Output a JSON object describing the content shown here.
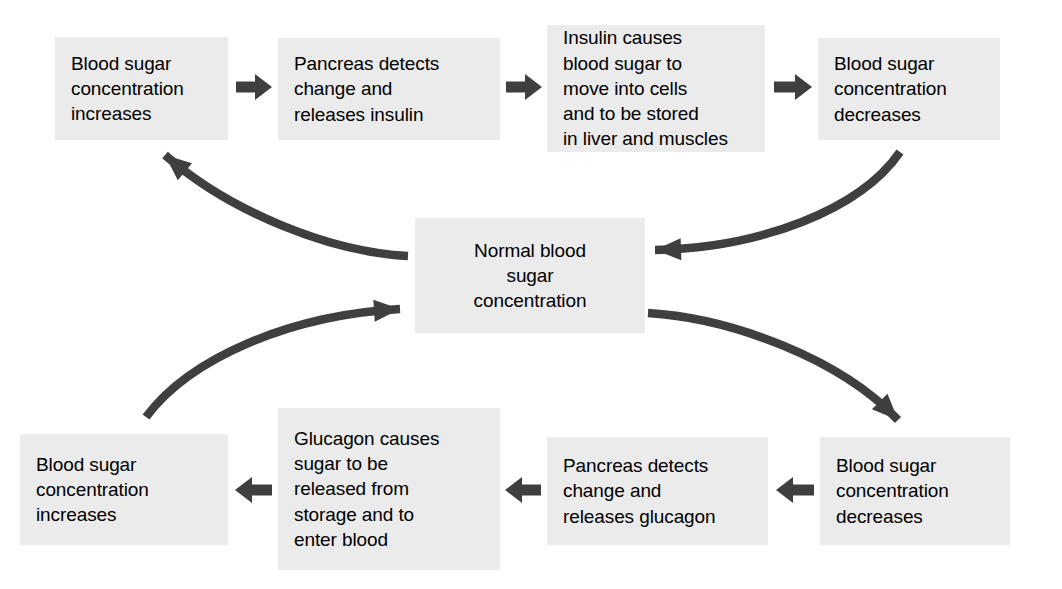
{
  "diagram": {
    "colors": {
      "box_fill": "#ebebeb",
      "text": "#000000",
      "arrow": "#3f3f3f",
      "background": "#ffffff"
    },
    "nodes": [
      {
        "id": "node-top-1",
        "name": "blood-sugar-increases-top",
        "label": "Blood sugar\nconcentration\nincreases",
        "align": "left",
        "x": 55,
        "y": 37,
        "w": 173,
        "h": 103
      },
      {
        "id": "node-top-2",
        "name": "pancreas-releases-insulin",
        "label": "Pancreas detects\nchange and\nreleases insulin",
        "align": "left",
        "x": 278,
        "y": 38,
        "w": 222,
        "h": 102
      },
      {
        "id": "node-top-3",
        "name": "insulin-action",
        "label": "Insulin causes\nblood sugar to\nmove into cells\nand to be stored\nin liver and muscles",
        "align": "left",
        "x": 547,
        "y": 25,
        "w": 218,
        "h": 127
      },
      {
        "id": "node-top-4",
        "name": "blood-sugar-decreases-top",
        "label": "Blood sugar\nconcentration\ndecreases",
        "align": "left",
        "x": 818,
        "y": 38,
        "w": 182,
        "h": 102
      },
      {
        "id": "node-center",
        "name": "normal-blood-sugar-concentration",
        "label": "Normal blood\nsugar\nconcentration",
        "align": "center",
        "x": 415,
        "y": 218,
        "w": 230,
        "h": 115
      },
      {
        "id": "node-bottom-1",
        "name": "blood-sugar-increases-bottom",
        "label": "Blood sugar\nconcentration\nincreases",
        "align": "left",
        "x": 20,
        "y": 434,
        "w": 208,
        "h": 111
      },
      {
        "id": "node-bottom-2",
        "name": "glucagon-action",
        "label": "Glucagon causes\nsugar to be\nreleased from\nstorage and to\nenter blood",
        "align": "left",
        "x": 278,
        "y": 408,
        "w": 222,
        "h": 162
      },
      {
        "id": "node-bottom-3",
        "name": "pancreas-releases-glucagon",
        "label": "Pancreas detects\nchange and\nreleases glucagon",
        "align": "left",
        "x": 547,
        "y": 437,
        "w": 221,
        "h": 108
      },
      {
        "id": "node-bottom-4",
        "name": "blood-sugar-decreases-bottom",
        "label": "Blood sugar\nconcentration\ndecreases",
        "align": "left",
        "x": 820,
        "y": 437,
        "w": 190,
        "h": 108
      }
    ],
    "straight_arrows": [
      {
        "name": "arrow-top-1-to-2",
        "direction": "right",
        "x1": 236,
        "y1": 87,
        "x2": 272,
        "y2": 87
      },
      {
        "name": "arrow-top-2-to-3",
        "direction": "right",
        "x1": 506,
        "y1": 87,
        "x2": 542,
        "y2": 87
      },
      {
        "name": "arrow-top-3-to-4",
        "direction": "right",
        "x1": 774,
        "y1": 87,
        "x2": 812,
        "y2": 87
      },
      {
        "name": "arrow-bottom-4-to-3",
        "direction": "left",
        "x1": 814,
        "y1": 490,
        "x2": 776,
        "y2": 490
      },
      {
        "name": "arrow-bottom-3-to-2",
        "direction": "left",
        "x1": 541,
        "y1": 490,
        "x2": 505,
        "y2": 490
      },
      {
        "name": "arrow-bottom-2-to-1",
        "direction": "left",
        "x1": 272,
        "y1": 490,
        "x2": 235,
        "y2": 490
      }
    ],
    "curved_arrows": [
      {
        "name": "curve-center-to-top-left",
        "from": "node-center",
        "to": "node-top-1",
        "path": "M 408 256 C 330 252 230 212 165 155"
      },
      {
        "name": "curve-top-right-to-center",
        "from": "node-top-4",
        "to": "node-center",
        "path": "M 900 152 C 860 210 760 248 655 250"
      },
      {
        "name": "curve-center-to-bottom-right",
        "from": "node-center",
        "to": "node-bottom-4",
        "path": "M 648 313 C 730 318 840 358 898 420"
      },
      {
        "name": "curve-bottom-left-to-center",
        "from": "node-bottom-1",
        "to": "node-center",
        "path": "M 146 417 C 190 358 290 315 400 309"
      }
    ]
  }
}
